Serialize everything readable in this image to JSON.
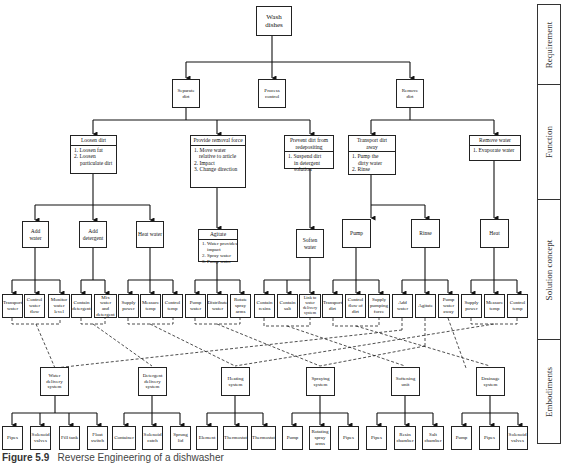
{
  "diagram": {
    "title": "Reverse Engineering of a dishwasher",
    "caption": {
      "label": "Figure 5.9",
      "text": "Reverse Engineering of a dishwasher"
    },
    "levels": [
      "Requirement",
      "Function",
      "Solution concept",
      "Embodiments"
    ],
    "requirement": {
      "root": "Wash dishes",
      "children": [
        "Separate dirt",
        "Process control",
        "Remove dirt"
      ]
    },
    "functions": [
      {
        "title": "Loosen dirt",
        "items": [
          "1. Loosen fat",
          "2. Loosen",
          "particulate dirt"
        ]
      },
      {
        "title": "Provide removal force",
        "items": [
          "1. Move water",
          "relative to article",
          "2. Impact",
          "3. Change direction"
        ]
      },
      {
        "title": "Prevent dirt from redepositing",
        "items": [
          "1. Suspend dirt",
          "in detergent",
          "solution"
        ]
      },
      {
        "title": "Transport dirt away",
        "items": [
          "1. Pump the",
          "dirty water",
          "2. Rinse"
        ]
      },
      {
        "title": "Remove water",
        "items": [
          "1. Evaporate water"
        ]
      }
    ],
    "concepts": [
      {
        "label": "Add water",
        "children": [
          "Transport water",
          "Control water flow",
          "Monitor water level"
        ]
      },
      {
        "label": "Add detergent",
        "children": [
          "Contain detergent",
          "Mix water and detergent"
        ]
      },
      {
        "label": "Heat water",
        "children": [
          "Supply power",
          "Measure temp",
          "Control temp"
        ]
      },
      {
        "label": "Agitate",
        "items": [
          "1. Water provides",
          "impact",
          "2. Spray water",
          "3. Pump water"
        ],
        "children": [
          "Pump water",
          "Distribute water",
          "Rotate spray arms"
        ]
      },
      {
        "label": "Soften water",
        "children": [
          "Contain resins",
          "Contain salt",
          "Link to water delivery system"
        ]
      },
      {
        "label": "Pump",
        "children": [
          "Transport dirt",
          "Control flow of dirt",
          "Supply pumping force"
        ]
      },
      {
        "label": "Rinse",
        "children": [
          "Add water",
          "Agitate",
          "Pump water away"
        ]
      },
      {
        "label": "Heat",
        "children": [
          "Supply power",
          "Measure temp",
          "Control temp"
        ]
      }
    ],
    "embodiments": [
      {
        "label": "Water delivery system",
        "parts": [
          "Pipes",
          "Solenoid valves",
          "Fill tank",
          "Float switch"
        ]
      },
      {
        "label": "Detergent delivery system",
        "parts": [
          "Container",
          "Solenoid catch",
          "Sprung lid"
        ]
      },
      {
        "label": "Heating system",
        "parts": [
          "Element",
          "Thermostat",
          "Thermostat"
        ]
      },
      {
        "label": "Spraying system",
        "parts": [
          "Pump",
          "Rotating spray arms",
          "Pipes"
        ]
      },
      {
        "label": "Softening unit",
        "parts": [
          "Pipes",
          "Resin chamber",
          "Salt chamber"
        ]
      },
      {
        "label": "Drainage system",
        "parts": [
          "Pump",
          "Pipes",
          "Solenoid valves"
        ]
      }
    ]
  }
}
